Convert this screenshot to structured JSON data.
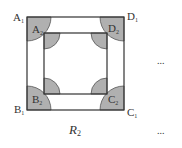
{
  "diagram": {
    "caption": "R",
    "caption_sub": "2",
    "outer_square": {
      "vertices": [
        {
          "name": "A",
          "sub": "1"
        },
        {
          "name": "B",
          "sub": "1"
        },
        {
          "name": "C",
          "sub": "1"
        },
        {
          "name": "D",
          "sub": "1"
        }
      ]
    },
    "inner_square": {
      "vertices": [
        {
          "name": "A",
          "sub": "2"
        },
        {
          "name": "B",
          "sub": "2"
        },
        {
          "name": "C",
          "sub": "2"
        },
        {
          "name": "D",
          "sub": "2"
        }
      ]
    },
    "ellipsis_top": "...",
    "ellipsis_bottom": "...",
    "colors": {
      "stroke": "#333333",
      "sector_fill": "#b0b0b0"
    }
  }
}
